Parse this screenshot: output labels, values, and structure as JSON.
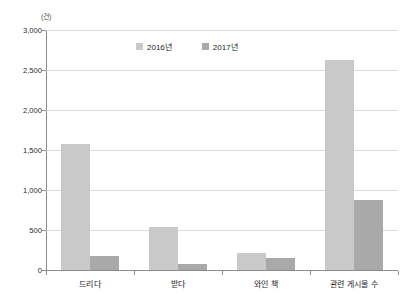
{
  "chart_data": {
    "type": "bar",
    "title": "",
    "subtitle": "",
    "unit_label": "(건)",
    "xlabel": "",
    "ylabel": "",
    "ylim": [
      0,
      3000
    ],
    "ytick_step": 500,
    "grid": true,
    "legend_position": "top-center",
    "categories": [
      "드리다",
      "받다",
      "와인  책",
      "관련 게시물 수"
    ],
    "ytick_labels": [
      "3,000",
      "2,500",
      "2,000",
      "1,500",
      "1,000",
      "500",
      "0"
    ],
    "series": [
      {
        "name": "2016년",
        "color": "#c9c9c9",
        "values": [
          1570,
          540,
          210,
          2620
        ]
      },
      {
        "name": "2017년",
        "color": "#a9a9a9",
        "values": [
          170,
          80,
          145,
          880
        ]
      }
    ]
  },
  "legend": {
    "items": [
      {
        "label": "2016년",
        "color": "#c9c9c9"
      },
      {
        "label": "2017년",
        "color": "#a9a9a9"
      }
    ]
  }
}
